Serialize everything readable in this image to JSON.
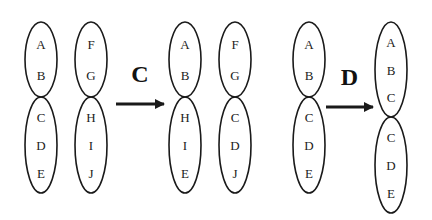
{
  "figure": {
    "panels": [
      {
        "id": "before-C",
        "chromosomes": [
          {
            "cx": 41,
            "top": 22,
            "centromere": 97,
            "bottom": 193,
            "upper": [
              "A",
              "B"
            ],
            "lower": [
              "C",
              "D",
              "E"
            ]
          },
          {
            "cx": 91,
            "top": 22,
            "centromere": 97,
            "bottom": 193,
            "upper": [
              "F",
              "G"
            ],
            "lower": [
              "H",
              "I",
              "J"
            ]
          }
        ]
      },
      {
        "id": "after-C",
        "chromosomes": [
          {
            "cx": 185,
            "top": 22,
            "centromere": 97,
            "bottom": 193,
            "upper": [
              "A",
              "B"
            ],
            "lower": [
              "H",
              "I",
              "E"
            ]
          },
          {
            "cx": 235,
            "top": 22,
            "centromere": 97,
            "bottom": 193,
            "upper": [
              "F",
              "G"
            ],
            "lower": [
              "C",
              "D",
              "J"
            ]
          }
        ]
      },
      {
        "id": "before-D",
        "chromosomes": [
          {
            "cx": 309,
            "top": 22,
            "centromere": 97,
            "bottom": 193,
            "upper": [
              "A",
              "B"
            ],
            "lower": [
              "C",
              "D",
              "E"
            ]
          }
        ]
      },
      {
        "id": "after-D",
        "chromosomes": [
          {
            "cx": 391,
            "top": 22,
            "centromere": 117,
            "bottom": 213,
            "upper": [
              "A",
              "B",
              "C"
            ],
            "lower": [
              "C",
              "D",
              "E"
            ]
          }
        ]
      }
    ],
    "transitions": [
      {
        "label": "C",
        "arrow_from": 116,
        "arrow_to": 164,
        "y": 104
      },
      {
        "label": "D",
        "arrow_from": 326,
        "arrow_to": 373,
        "y": 107
      }
    ]
  }
}
